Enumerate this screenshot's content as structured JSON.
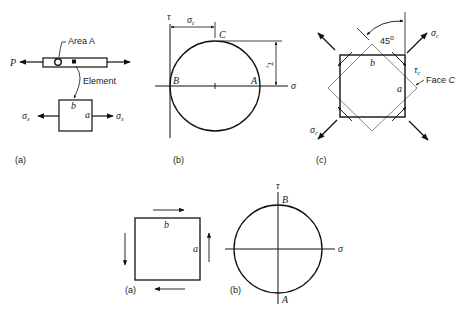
{
  "figure_top": {
    "panel_a": {
      "caption": "(a)",
      "load_label": "P",
      "area_label": "Area A",
      "element_label": "Element",
      "face_b": "b",
      "face_a": "a",
      "stress_left": "σ",
      "stress_left_sub": "x",
      "stress_right": "σ",
      "stress_right_sub": "x"
    },
    "panel_b": {
      "caption": "(b)",
      "tau_axis": "τ",
      "sigma_axis": "σ",
      "sigma_c": "σ",
      "sigma_c_sub": "c",
      "tau_c": "τ",
      "tau_c_sub": "c",
      "point_a": "A",
      "point_b": "B",
      "point_c": "C"
    },
    "panel_c": {
      "caption": "(c)",
      "angle": "45",
      "angle_unit": "o",
      "sigma_c_top": "σ",
      "sigma_c_top_sub": "c",
      "sigma_c_bottom": "σ",
      "sigma_c_bottom_sub": "c",
      "tau_c": "τ",
      "tau_c_sub": "c",
      "face_label": "Face ",
      "face_letter": "C",
      "face_b": "b",
      "face_a": "a"
    }
  },
  "figure_bottom": {
    "panel_a": {
      "caption": "(a)",
      "face_b": "b",
      "face_a": "a"
    },
    "panel_b": {
      "caption": "(b)",
      "tau_axis": "τ",
      "sigma_axis": "σ",
      "point_a": "A",
      "point_b": "B"
    }
  }
}
